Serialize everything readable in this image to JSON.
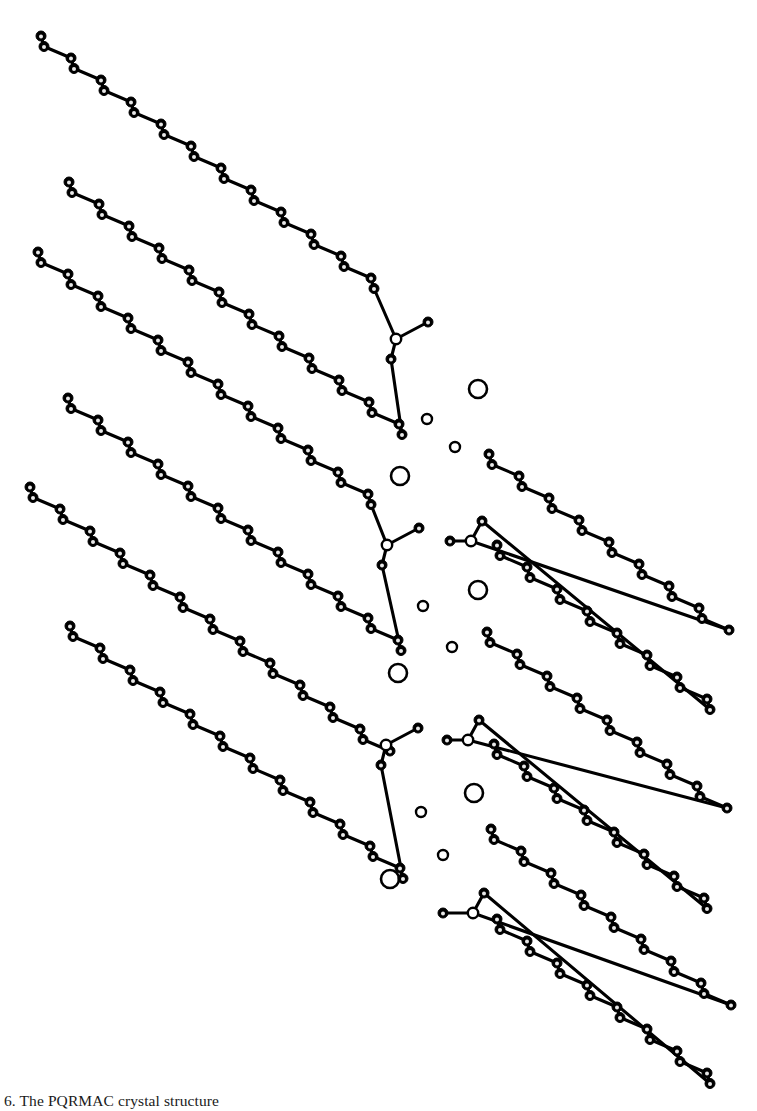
{
  "figure": {
    "kind": "crystal-packing-diagram",
    "background_color": "#ffffff",
    "ink_color": "#000000",
    "width": 757,
    "height": 1111
  },
  "caption": {
    "label": "6.",
    "text": "6.  The PQRMAC crystal structure"
  },
  "legend": {
    "chain_atom": "filled-ellipsoid-atom",
    "head_atom": "open-circle-head-atom",
    "large_site": "large-open-circle-site",
    "small_site": "small-open-circle-site"
  },
  "style": {
    "bond_width": 3.1,
    "atom_radius": 5.0,
    "atom_inner_radius": 2.0,
    "atom_fill": "#000000",
    "atom_inner_fill": "#e8e8e8",
    "atom_stroke": "#000000",
    "head_radius": 5.2,
    "head_fill": "#ffffff",
    "large_site_radius": 9.0,
    "large_site_stroke_width": 2.6,
    "small_site_radius": 5.0,
    "small_site_stroke_width": 2.4,
    "site_fill": "#ffffff"
  },
  "chart_data": {
    "type": "scatter",
    "xlabel": "",
    "ylabel": "",
    "xlim": [
      0,
      757
    ],
    "ylim": [
      0,
      1111
    ],
    "grid": false,
    "legend_position": "none",
    "geometry": {
      "zigzag_pair_dx": 3.0,
      "zigzag_pair_dy": 10.5,
      "zigzag_step_dx": 27.0,
      "zigzag_step_dy": 11.5,
      "chain_direction_left": "down-right",
      "chain_direction_right": "down-right"
    },
    "molecules": [
      {
        "id": "mol-L1",
        "handedness": "left",
        "head": [
          396,
          339
        ],
        "terminal_branch": [
          428,
          322
        ],
        "link_atom": [
          391,
          359
        ],
        "chains": [
          {
            "id": "L1-chain-a",
            "start": [
              41,
              36
            ],
            "n_carbons": 24,
            "dir": 1
          },
          {
            "id": "L1-chain-b",
            "start": [
              69,
              182
            ],
            "n_carbons": 24,
            "dir": 1
          }
        ]
      },
      {
        "id": "mol-L2",
        "handedness": "left",
        "head": [
          387,
          545
        ],
        "terminal_branch": [
          419,
          528
        ],
        "link_atom": [
          382,
          565
        ],
        "chains": [
          {
            "id": "L2-chain-a",
            "start": [
              38,
              252
            ],
            "n_carbons": 24,
            "dir": 1
          },
          {
            "id": "L2-chain-b",
            "start": [
              68,
              398
            ],
            "n_carbons": 24,
            "dir": 1
          }
        ]
      },
      {
        "id": "mol-L3",
        "handedness": "left",
        "head": [
          386,
          745
        ],
        "terminal_branch": [
          418,
          728
        ],
        "link_atom": [
          381,
          765
        ],
        "chains": [
          {
            "id": "L3-chain-a",
            "start": [
              30,
              487
            ],
            "n_carbons": 25,
            "dir": 1
          },
          {
            "id": "L3-chain-b",
            "start": [
              70,
              626
            ],
            "n_carbons": 24,
            "dir": 1
          }
        ]
      },
      {
        "id": "mol-R1",
        "handedness": "right",
        "head": [
          471,
          541
        ],
        "terminal_branch": [
          450,
          541
        ],
        "link_atom": [
          482,
          521
        ],
        "chains": [
          {
            "id": "R1-chain-a",
            "start": [
              489,
              454
            ],
            "n_carbons": 17,
            "dir": 1
          },
          {
            "id": "R1-chain-b",
            "start": [
              497,
              545
            ],
            "n_carbons": 16,
            "dir": 1
          }
        ]
      },
      {
        "id": "mol-R2",
        "handedness": "right",
        "head": [
          468,
          740
        ],
        "terminal_branch": [
          447,
          740
        ],
        "link_atom": [
          479,
          720
        ],
        "chains": [
          {
            "id": "R2-chain-a",
            "start": [
              487,
              632
            ],
            "n_carbons": 17,
            "dir": 1
          },
          {
            "id": "R2-chain-b",
            "start": [
              494,
              744
            ],
            "n_carbons": 16,
            "dir": 1
          }
        ]
      },
      {
        "id": "mol-R3",
        "handedness": "right",
        "head": [
          473,
          913
        ],
        "terminal_branch": [
          443,
          913
        ],
        "link_atom": [
          484,
          893
        ],
        "chains": [
          {
            "id": "R3-chain-a",
            "start": [
              491,
              829
            ],
            "n_carbons": 17,
            "dir": 1
          },
          {
            "id": "R3-chain-b",
            "start": [
              497,
              919
            ],
            "n_carbons": 16,
            "dir": 1
          }
        ]
      }
    ],
    "interstitial_sites": [
      {
        "id": "site-1",
        "x": 478,
        "y": 389,
        "size": "large"
      },
      {
        "id": "site-2",
        "x": 427,
        "y": 419,
        "size": "small"
      },
      {
        "id": "site-3",
        "x": 455,
        "y": 447,
        "size": "small"
      },
      {
        "id": "site-4",
        "x": 400,
        "y": 476,
        "size": "large"
      },
      {
        "id": "site-5",
        "x": 478,
        "y": 590,
        "size": "large"
      },
      {
        "id": "site-6",
        "x": 423,
        "y": 606,
        "size": "small"
      },
      {
        "id": "site-7",
        "x": 452,
        "y": 647,
        "size": "small"
      },
      {
        "id": "site-8",
        "x": 398,
        "y": 673,
        "size": "large"
      },
      {
        "id": "site-9",
        "x": 474,
        "y": 793,
        "size": "large"
      },
      {
        "id": "site-10",
        "x": 421,
        "y": 812,
        "size": "small"
      },
      {
        "id": "site-11",
        "x": 443,
        "y": 855,
        "size": "small"
      },
      {
        "id": "site-12",
        "x": 390,
        "y": 879,
        "size": "large"
      }
    ]
  }
}
